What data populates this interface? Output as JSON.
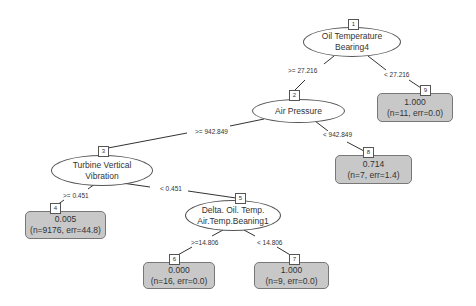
{
  "nodes": {
    "n1": {
      "id": "1",
      "line1": "Oil Temperature",
      "line2": "Bearing4"
    },
    "n2": {
      "id": "2",
      "line1": "Air Pressure"
    },
    "n3": {
      "id": "3",
      "line1": "Turbine Vertical",
      "line2": "Vibration"
    },
    "n5": {
      "id": "5",
      "line1": "Delta. Oil. Temp.",
      "line2": "Air.Temp.Beaning1"
    }
  },
  "leaves": {
    "n4": {
      "id": "4",
      "value": "0.005",
      "stats": "(n=9176, err=44.8)"
    },
    "n6": {
      "id": "6",
      "value": "0.000",
      "stats": "(n=16, err=0.0)"
    },
    "n7": {
      "id": "7",
      "value": "1.000",
      "stats": "(n=9, err=0.0)"
    },
    "n8": {
      "id": "8",
      "value": "0.714",
      "stats": "(n=7, err=1.4)"
    },
    "n9": {
      "id": "9",
      "value": "1.000",
      "stats": "(n=11, err=0.0)"
    }
  },
  "edges": {
    "e1_2": ">= 27.216",
    "e1_9": "< 27.216",
    "e2_3": ">= 942.849",
    "e2_8": "< 942.849",
    "e3_4": ">= 0.451",
    "e3_5": "< 0.451",
    "e5_6": ">=14.806",
    "e5_7": "< 14.806"
  },
  "colors": {
    "leaf_fill": "#c8c8c8",
    "edge": "#333333"
  }
}
